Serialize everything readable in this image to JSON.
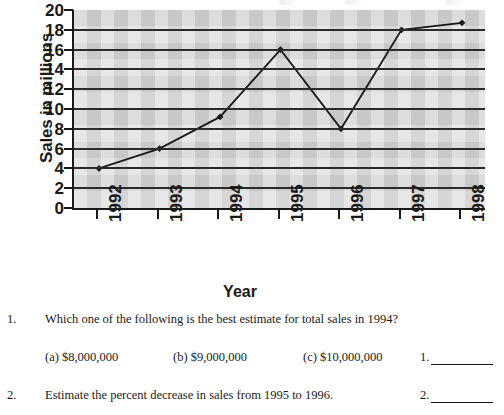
{
  "chart_data": {
    "type": "line",
    "title": "",
    "xlabel": "Year",
    "ylabel": "Sales in millions",
    "categories": [
      "1992",
      "1993",
      "1994",
      "1995",
      "1996",
      "1997",
      "1998"
    ],
    "values": [
      4,
      6,
      9.2,
      16,
      8,
      18,
      18.7
    ],
    "series": [
      {
        "name": "Sales",
        "values": [
          4,
          6,
          9.2,
          16,
          8,
          18,
          18.7
        ]
      }
    ],
    "ylim": [
      0,
      20
    ],
    "ytick_step": 2,
    "ytick_labels": [
      "20",
      "18",
      "16",
      "14",
      "12",
      "10",
      "8",
      "6",
      "4",
      "2",
      "0"
    ],
    "grid": true,
    "legend": "none",
    "plot_background_color": "#d3d3d3",
    "gridline_color": "#2b2b2b",
    "line_color": "#1a1a1a",
    "marker": "diamond"
  },
  "questions": [
    {
      "number": "1.",
      "text": "Which one of the following is the best estimate for total sales in 1994?",
      "choices": [
        "(a) $8,000,000",
        "(b) $9,000,000",
        "(c) $10,000,000"
      ],
      "answer_label": "1.",
      "answer_value": ""
    },
    {
      "number": "2.",
      "text": "Estimate the percent decrease in sales from 1995 to 1996.",
      "choices": [],
      "answer_label": "2.",
      "answer_value": ""
    }
  ]
}
